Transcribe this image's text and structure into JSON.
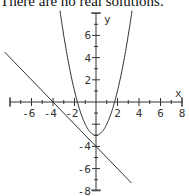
{
  "caption": "There are no real solutions.",
  "chart_data": {
    "type": "line",
    "title": "",
    "xlabel": "x",
    "ylabel": "y",
    "xlim": [
      -8,
      8
    ],
    "ylim": [
      -8,
      8
    ],
    "x_ticks": [
      -6,
      -4,
      -2,
      2,
      4,
      6,
      8
    ],
    "y_ticks": [
      6,
      4,
      2,
      -4,
      -6,
      -8
    ],
    "grid": false,
    "series": [
      {
        "name": "parabola",
        "equation": "y = x^2 - 3"
      },
      {
        "name": "line",
        "equation": "y = -x - 4"
      }
    ]
  }
}
